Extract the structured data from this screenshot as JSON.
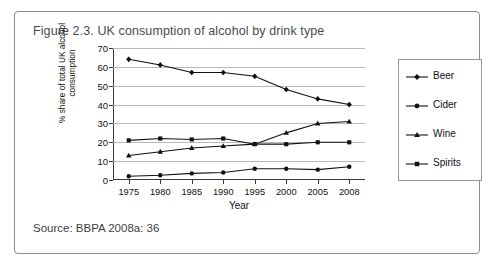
{
  "figure": {
    "title": "Figure 2.3. UK consumption of alcohol by drink type",
    "source": "Source: BBPA 2008a: 36"
  },
  "chart_data": {
    "type": "line",
    "title": "Figure 2.3. UK consumption of alcohol by drink type",
    "xlabel": "Year",
    "ylabel": "% share of total UK alcohol\nconsumption",
    "categories": [
      "1975",
      "1980",
      "1985",
      "1990",
      "1995",
      "2000",
      "2005",
      "2008"
    ],
    "ylim": [
      0,
      70
    ],
    "yticks": [
      0,
      10,
      20,
      30,
      40,
      50,
      60,
      70
    ],
    "grid": true,
    "legend_position": "right",
    "series": [
      {
        "name": "Beer",
        "marker": "diamond",
        "values": [
          64,
          61,
          57,
          57,
          55,
          48,
          43,
          40
        ]
      },
      {
        "name": "Cider",
        "marker": "circle",
        "values": [
          2,
          2.5,
          3.5,
          4,
          6,
          6,
          5.5,
          7
        ]
      },
      {
        "name": "Wine",
        "marker": "triangle",
        "values": [
          13,
          15,
          17,
          18,
          19,
          25,
          30,
          31
        ]
      },
      {
        "name": "Spirits",
        "marker": "square",
        "values": [
          21,
          22,
          21.5,
          22,
          19,
          19,
          20,
          20
        ]
      }
    ]
  },
  "legend": {
    "items": [
      {
        "label": "Beer"
      },
      {
        "label": "Cider"
      },
      {
        "label": "Wine"
      },
      {
        "label": "Spirits"
      }
    ]
  }
}
